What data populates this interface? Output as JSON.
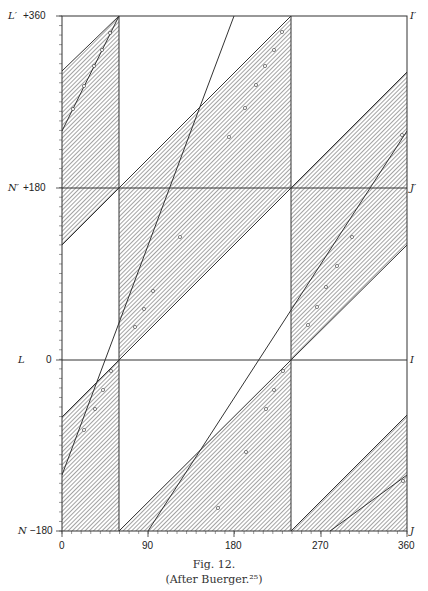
{
  "figure": {
    "caption": "Fig. 12.",
    "source": "(After Buerger.²⁵)"
  },
  "axes": {
    "x_ticks": [
      "0",
      "90",
      "180",
      "270",
      "360"
    ],
    "y_ticks": [
      "+360",
      "+180",
      "0",
      "−180"
    ],
    "left_labels": [
      "L′",
      "N′",
      "L",
      "N"
    ],
    "right_labels": [
      "I′",
      "J′",
      "I",
      "J"
    ]
  },
  "colors": {
    "line": "#333333",
    "hatch": "#555555",
    "background": "#ffffff"
  },
  "chart_data": {
    "type": "diagram",
    "xlim": [
      0,
      360
    ],
    "ylim": [
      -180,
      360
    ],
    "x_ticks": [
      0,
      90,
      180,
      270,
      360
    ],
    "y_ticks": [
      -180,
      0,
      180,
      360
    ],
    "horizontal_reference_lines": [
      0,
      180
    ],
    "vertical_boundaries": [
      60,
      240
    ],
    "shaded_regions": "diagonal slope-1 bands bounded by vertical lines at x=60 and x=240, hatched",
    "steep_lines": [
      {
        "through": [
          60,
          0
        ],
        "slope": 3
      },
      {
        "through": [
          240,
          0
        ],
        "slope": 3
      }
    ],
    "left_labels": {
      "L′": 360,
      "N′": 180,
      "L": 0,
      "N": -180
    },
    "right_labels": {
      "I′": 360,
      "J′": 180,
      "I": 0,
      "J": -180
    }
  }
}
